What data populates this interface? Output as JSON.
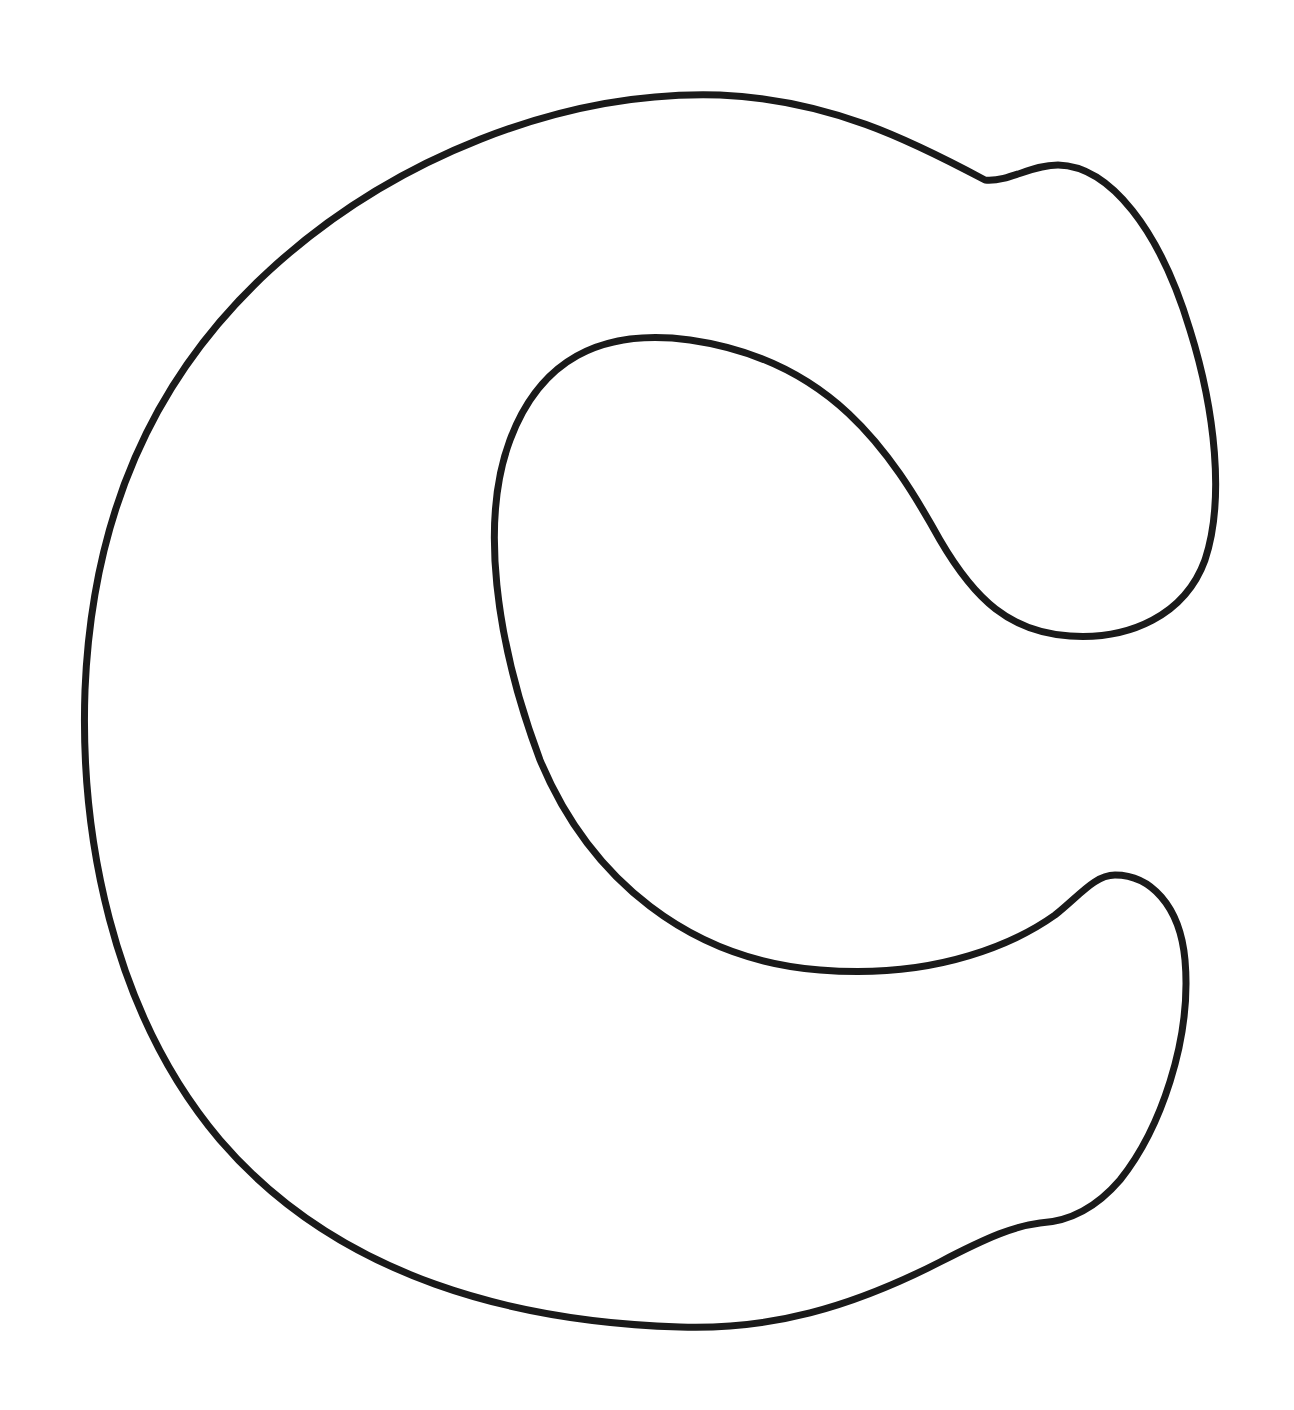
{
  "image": {
    "subject": "Outline of the letter C",
    "letter": "C",
    "background_color": "#ffffff",
    "stroke_color": "#1a1a1a",
    "stroke_width": 7
  }
}
